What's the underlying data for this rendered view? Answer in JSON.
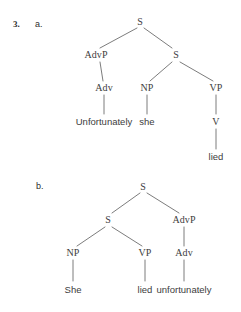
{
  "exercise": {
    "number": "3.",
    "parts": [
      {
        "label": "a."
      },
      {
        "label": "b."
      }
    ]
  },
  "trees": {
    "a": {
      "nodes": {
        "root_s": "S",
        "advp": "AdvP",
        "embedded_s": "S",
        "adv": "Adv",
        "np": "NP",
        "vp": "VP",
        "v": "V"
      },
      "leaves": {
        "adv_word": "Unfortunately",
        "np_word": "she",
        "v_word": "lied"
      },
      "sentence": "Unfortunately she lied"
    },
    "b": {
      "nodes": {
        "root_s": "S",
        "embedded_s": "S",
        "advp": "AdvP",
        "np": "NP",
        "vp": "VP",
        "adv": "Adv"
      },
      "leaves": {
        "np_word": "She",
        "vp_word": "lied",
        "adv_word": "unfortunately"
      },
      "sentence": "She lied unfortunately"
    }
  },
  "colors": {
    "background": "#ffffff",
    "text": "#3d3d3d",
    "line": "#5a5a5a"
  }
}
